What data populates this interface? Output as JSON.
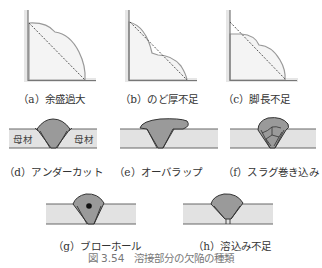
{
  "figure": {
    "caption": "図 3.54　溶接部分の欠陥の種類",
    "colors": {
      "plate_line": "#888888",
      "bead_outline": "#999999",
      "base_metal_fill": "#e2e2e2",
      "weld_fill": "#9a9a9a",
      "fillet_fill": "#f4f4f4",
      "outline_dark": "#333333",
      "caption_text": "#777777"
    },
    "panels": [
      {
        "id": "a",
        "label": "（a）余盛過大",
        "type": "fillet"
      },
      {
        "id": "b",
        "label": "（b）のど厚不足",
        "type": "fillet"
      },
      {
        "id": "c",
        "label": "（c）脚長不足",
        "type": "fillet"
      },
      {
        "id": "d",
        "label": "（d）アンダーカット",
        "type": "butt",
        "annotations": [
          "母材",
          "母材"
        ]
      },
      {
        "id": "e",
        "label": "（e）オーバラップ",
        "type": "butt"
      },
      {
        "id": "f",
        "label": "（f）スラグ巻き込み",
        "type": "butt"
      },
      {
        "id": "g",
        "label": "（g）ブローホール",
        "type": "butt"
      },
      {
        "id": "h",
        "label": "（h）溶込み不足",
        "type": "butt"
      }
    ]
  }
}
